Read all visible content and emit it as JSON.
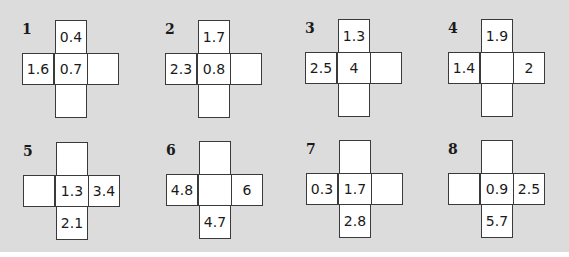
{
  "puzzles": [
    {
      "number": "1",
      "top": "0.4",
      "left": "1.6",
      "center": "0.7",
      "right": "",
      "bottom": ""
    },
    {
      "number": "2",
      "top": "1.7",
      "left": "2.3",
      "center": "0.8",
      "right": "",
      "bottom": ""
    },
    {
      "number": "3",
      "top": "1.3",
      "left": "2.5",
      "center": "4",
      "right": "",
      "bottom": ""
    },
    {
      "number": "4",
      "top": "1.9",
      "left": "1.4",
      "center": "",
      "right": "2",
      "bottom": ""
    },
    {
      "number": "5",
      "top": "",
      "left": "",
      "center": "1.3",
      "right": "3.4",
      "bottom": "2.1"
    },
    {
      "number": "6",
      "top": "",
      "left": "4.8",
      "center": "",
      "right": "6",
      "bottom": "4.7"
    },
    {
      "number": "7",
      "top": "",
      "left": "0.3",
      "center": "1.7",
      "right": "",
      "bottom": "2.8"
    },
    {
      "number": "8",
      "top": "",
      "left": "",
      "center": "0.9",
      "right": "2.5",
      "bottom": "5.7"
    }
  ]
}
